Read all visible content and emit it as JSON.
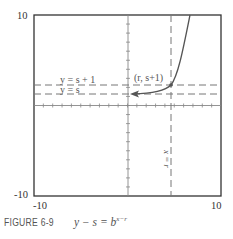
{
  "chart_data": {
    "type": "line",
    "title": "",
    "caption_label": "FIGURE 6-9",
    "caption_equation": "y − s = b^(x−r)",
    "caption_equation_parts": {
      "lhs": "y − s = b",
      "exponent": "x−r"
    },
    "xlim": [
      -10,
      10
    ],
    "ylim": [
      -10,
      10
    ],
    "tick_labels": {
      "x_min": "-10",
      "x_max": "10",
      "y_min": "-10",
      "y_max": "10"
    },
    "grid": false,
    "ticks_every": 1,
    "parameters": {
      "r": 3,
      "s": 2,
      "b": 2.2
    },
    "series": [
      {
        "name": "y - s = b^(x-r)",
        "style": "solid",
        "color": "#555555",
        "x": [
          -2.8,
          -1,
          0,
          1,
          2,
          3,
          4,
          5,
          6,
          6.8
        ],
        "y": [
          2.01,
          2.02,
          2.09,
          2.2,
          2.45,
          3.0,
          4.2,
          6.8,
          12.6,
          18.0
        ],
        "arrow_at_left": true
      }
    ],
    "reference_lines": [
      {
        "label": "y = s + 1",
        "orientation": "horizontal",
        "value": 3,
        "style": "dashed"
      },
      {
        "label": "y = s",
        "orientation": "horizontal",
        "value": 2,
        "style": "dashed"
      },
      {
        "label": "x = r",
        "orientation": "vertical",
        "value": 3,
        "style": "dashed"
      }
    ],
    "annotations": [
      {
        "text": "(r, s+1)",
        "x": 3,
        "y": 3,
        "point": true
      }
    ]
  },
  "labels": {
    "y_max": "10",
    "y_min": "-10",
    "x_min": "-10",
    "x_max": "10",
    "line_s_plus_1": "y = s + 1",
    "line_s": "y = s",
    "line_r": "x = r",
    "point": "(r, s+1)"
  },
  "caption": {
    "label": "FIGURE 6-9",
    "equation": "y − s = b",
    "exponent": "x−r"
  }
}
